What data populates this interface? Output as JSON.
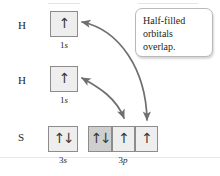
{
  "figure": {
    "callout": {
      "text": "Half-filled orbitals overlap."
    }
  },
  "rows": [
    {
      "symbol": "H",
      "symbol_x": 18,
      "symbol_y": 20,
      "orbitals": [
        {
          "subshell": "1",
          "subshell_italic": "s",
          "electrons": "↑",
          "paired": false,
          "shaded": false,
          "x": 50,
          "y": 11,
          "w": 28,
          "h": 26,
          "cap_x": 50,
          "cap_y": 41,
          "cap_w": 28
        }
      ]
    },
    {
      "symbol": "H",
      "symbol_x": 18,
      "symbol_y": 75,
      "orbitals": [
        {
          "subshell": "1",
          "subshell_italic": "s",
          "electrons": "↑",
          "paired": false,
          "shaded": false,
          "x": 50,
          "y": 66,
          "w": 28,
          "h": 26,
          "cap_x": 50,
          "cap_y": 96,
          "cap_w": 28
        }
      ]
    },
    {
      "symbol": "S",
      "symbol_x": 18,
      "symbol_y": 132,
      "orbitals": [
        {
          "subshell": "3",
          "subshell_italic": "s",
          "electrons": "↑↓",
          "paired": true,
          "shaded": false,
          "x": 48,
          "y": 126,
          "w": 30,
          "h": 26,
          "cap_x": 48,
          "cap_y": 156,
          "cap_w": 30
        },
        {
          "subshell": "3",
          "subshell_italic": "p",
          "electrons": "↑↓",
          "paired": true,
          "shaded": true,
          "x": 88,
          "y": 126,
          "w": 24,
          "h": 26,
          "cap_x": 88,
          "cap_y": 156,
          "cap_w": 70
        },
        {
          "subshell": "",
          "subshell_italic": "",
          "electrons": "↑",
          "paired": false,
          "shaded": false,
          "x": 112,
          "y": 126,
          "w": 23,
          "h": 26
        },
        {
          "subshell": "",
          "subshell_italic": "",
          "electrons": "↑",
          "paired": false,
          "shaded": false,
          "x": 135,
          "y": 126,
          "w": 23,
          "h": 26
        }
      ]
    }
  ],
  "connectors": [
    {
      "name": "overlap-arrow-h1-to-3p3",
      "path": "M 82,22 C 120,30 146,70 147,120",
      "from": "H 1s (top)",
      "to": "S 3p (third box)"
    },
    {
      "name": "overlap-arrow-h2-to-3p2",
      "path": "M 82,78 C 100,88 116,98 124,118",
      "from": "H 1s (second)",
      "to": "S 3p (second box)"
    }
  ],
  "colors": {
    "box_fill": "#eeeeee",
    "box_fill_shaded": "#cfcfcf",
    "box_border": "#8c8c8c",
    "arrow": "#6f6f6f",
    "text": "#231f20",
    "callout_border": "#b9b9b9",
    "rule": "#e3e3e3"
  }
}
